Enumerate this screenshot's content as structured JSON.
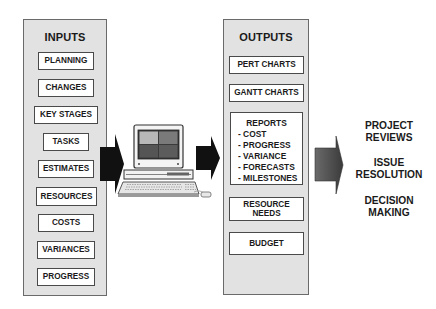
{
  "inputs": {
    "title": "INPUTS",
    "items": [
      {
        "label": "PLANNING"
      },
      {
        "label": "CHANGES"
      },
      {
        "label": "KEY STAGES"
      },
      {
        "label": "TASKS"
      },
      {
        "label": "ESTIMATES"
      },
      {
        "label": "RESOURCES"
      },
      {
        "label": "COSTS"
      },
      {
        "label": "VARIANCES"
      },
      {
        "label": "PROGRESS"
      }
    ]
  },
  "processor": {
    "icon": "computer-workstation-icon"
  },
  "outputs": {
    "title": "OUTPUTS",
    "pert": "PERT CHARTS",
    "gantt": "GANTT CHARTS",
    "reports": {
      "title": "REPORTS",
      "items": [
        "- COST",
        "- PROGRESS",
        "- VARIANCE",
        "- FORECASTS",
        "- MILESTONES"
      ]
    },
    "resource_needs": {
      "line1": "RESOURCE",
      "line2": "NEEDS"
    },
    "budget": "BUDGET"
  },
  "results": [
    {
      "line1": "PROJECT",
      "line2": "REVIEWS"
    },
    {
      "line1": "ISSUE",
      "line2": "RESOLUTION"
    },
    {
      "line1": "DECISION",
      "line2": "MAKING"
    }
  ],
  "colors": {
    "panel_fill": "#e2e2e2",
    "arrow_dark": "#111111",
    "arrow_gray": "#555555"
  }
}
